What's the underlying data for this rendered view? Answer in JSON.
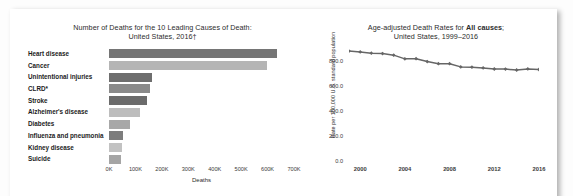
{
  "page": {
    "background": "#fdfdfd",
    "card_background": "#ffffff"
  },
  "bar_chart": {
    "title_line1": "Number of Deaths for the 10 Leading Causes of Death:",
    "title_line2": "United States, 2016†",
    "xlabel": "Deaths",
    "xticks": [
      "0K",
      "100K",
      "200K",
      "300K",
      "400K",
      "500K",
      "600K",
      "700K"
    ]
  },
  "line_chart": {
    "title_prefix": "Age-adjusted Death Rates for ",
    "title_bold": "All causes",
    "title_suffix": ";",
    "title_line2": "United States, 1999–2016",
    "ylabel": "Rate per 100,000 U.S. standard population",
    "yticks": [
      "0.0",
      "200.0",
      "400.0",
      "600.0",
      "800.0"
    ],
    "xticks": [
      "2000",
      "2004",
      "2008",
      "2012",
      "2016"
    ]
  },
  "chart_data": [
    {
      "type": "bar",
      "orientation": "horizontal",
      "title": "Number of Deaths for the 10 Leading Causes of Death: United States, 2016†",
      "xlabel": "Deaths",
      "ylabel": "",
      "xlim": [
        0,
        700000
      ],
      "grid": false,
      "legend": "none",
      "categories": [
        "Heart disease",
        "Cancer",
        "Unintentional injuries",
        "CLRD*",
        "Stroke",
        "Alzheimer's disease",
        "Diabetes",
        "Influenza and pneumonia",
        "Kidney disease",
        "Suicide"
      ],
      "values": [
        635260,
        598038,
        161374,
        154596,
        142142,
        116103,
        80058,
        51537,
        50046,
        44965
      ],
      "tick_labels": [
        "0K",
        "100K",
        "200K",
        "300K",
        "400K",
        "500K",
        "600K",
        "700K"
      ],
      "tick_values": [
        0,
        100000,
        200000,
        300000,
        400000,
        500000,
        600000,
        700000
      ],
      "colors": [
        "#757575",
        "#b5b5b5",
        "#6e6e6e",
        "#8a8a8a",
        "#6b6b6b",
        "#bdbdbd",
        "#a8a8a8",
        "#7d7d7d",
        "#c2c2c2",
        "#a5a5a5"
      ]
    },
    {
      "type": "line",
      "title": "Age-adjusted Death Rates for All causes; United States, 1999–2016",
      "xlabel": "",
      "ylabel": "Rate per 100,000 U.S. standard population",
      "ylim": [
        0,
        900
      ],
      "xlim": [
        1999,
        2016
      ],
      "grid": false,
      "legend": "none",
      "line_color": "#666666",
      "marker": "diamond",
      "tick_labels_y": [
        "0.0",
        "200.0",
        "400.0",
        "600.0",
        "800.0"
      ],
      "tick_values_y": [
        0,
        200,
        400,
        600,
        800
      ],
      "tick_labels_x": [
        "2000",
        "2004",
        "2008",
        "2012",
        "2016"
      ],
      "tick_values_x": [
        2000,
        2004,
        2008,
        2012,
        2016
      ],
      "x": [
        1999,
        2000,
        2001,
        2002,
        2003,
        2004,
        2005,
        2006,
        2007,
        2008,
        2009,
        2010,
        2011,
        2012,
        2013,
        2014,
        2015,
        2016
      ],
      "values": [
        875.6,
        869.0,
        858.8,
        855.9,
        843.0,
        813.7,
        815.0,
        791.8,
        775.3,
        774.9,
        749.6,
        747.0,
        741.3,
        732.8,
        731.9,
        724.6,
        733.1,
        728.8
      ]
    }
  ]
}
